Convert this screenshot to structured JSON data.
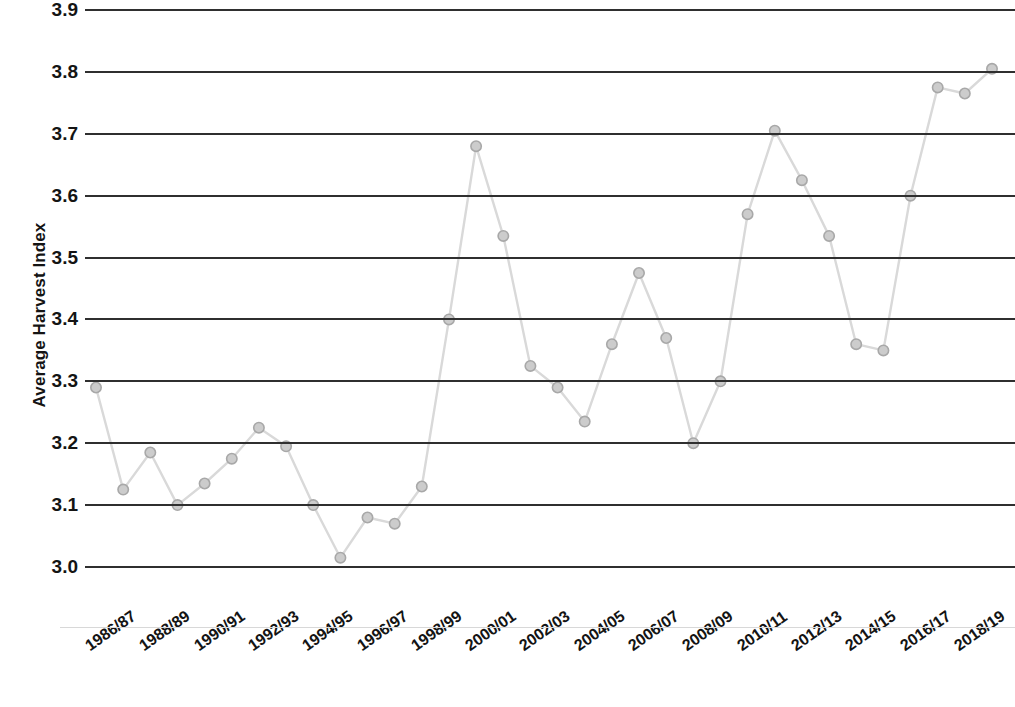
{
  "chart_data": {
    "type": "line",
    "title": "",
    "xlabel": "",
    "ylabel": "Average Harvest Index",
    "ylim": [
      2.95,
      3.93
    ],
    "yticks": [
      "3.0",
      "3.1",
      "3.2",
      "3.3",
      "3.4",
      "3.5",
      "3.6",
      "3.7",
      "3.8",
      "3.9"
    ],
    "ytick_values": [
      3.0,
      3.1,
      3.2,
      3.3,
      3.4,
      3.5,
      3.6,
      3.7,
      3.8,
      3.9
    ],
    "grid": "horizontal",
    "legend": "none",
    "series_color": "#d9d9d9",
    "marker_color": "#cccccc",
    "marker_edge_color": "#a8a8a8",
    "gridline_color": "#2f2f2f",
    "categories": [
      "1986/87",
      "1987/88",
      "1988/89",
      "1989/90",
      "1990/91",
      "1991/92",
      "1992/93",
      "1993/94",
      "1994/95",
      "1995/96",
      "1996/97",
      "1997/98",
      "1998/99",
      "1999/00",
      "2000/01",
      "2001/02",
      "2002/03",
      "2003/04",
      "2004/05",
      "2005/06",
      "2006/07",
      "2007/08",
      "2008/09",
      "2009/10",
      "2010/11",
      "2011/12",
      "2012/13",
      "2013/14",
      "2014/15",
      "2015/16",
      "2016/17",
      "2017/18",
      "2018/19",
      "2019/20"
    ],
    "xtick_labels": [
      "1986/87",
      "1988/89",
      "1990/91",
      "1992/93",
      "1994/95",
      "1996/97",
      "1998/99",
      "2000/01",
      "2002/03",
      "2004/05",
      "2006/07",
      "2008/09",
      "2010/11",
      "2012/13",
      "2014/15",
      "2016/17",
      "2018/19"
    ],
    "values": [
      3.29,
      3.125,
      3.185,
      3.1,
      3.135,
      3.175,
      3.225,
      3.195,
      3.1,
      3.015,
      3.08,
      3.07,
      3.13,
      3.4,
      3.68,
      3.535,
      3.325,
      3.29,
      3.235,
      3.36,
      3.475,
      3.37,
      3.2,
      3.3,
      3.57,
      3.705,
      3.625,
      3.535,
      3.36,
      3.35,
      3.6,
      3.775,
      3.765,
      3.805
    ]
  }
}
